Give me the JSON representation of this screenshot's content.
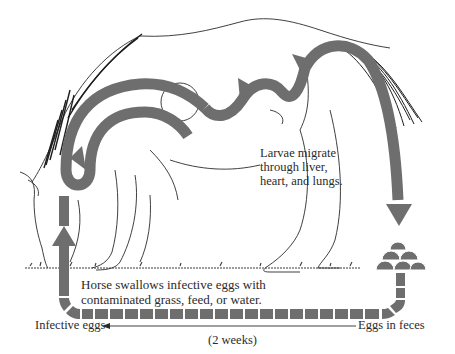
{
  "diagram": {
    "arrow_color": "#6e6e6e",
    "line_color": "#2a2a2a",
    "labels": {
      "migration": [
        "Larvae migrate",
        "through liver,",
        "heart, and lungs."
      ],
      "ingestion": [
        "Horse swallows infective eggs with",
        "contaminated grass, feed, or water."
      ],
      "infective_eggs": "Infective eggs",
      "eggs_in_feces": "Eggs in feces",
      "duration": "(2 weeks)"
    },
    "stages": [
      {
        "id": "ingestion",
        "description": "Horse swallows infective eggs"
      },
      {
        "id": "migration",
        "description": "Larvae migrate through liver, heart, and lungs"
      },
      {
        "id": "excretion",
        "description": "Eggs in feces"
      },
      {
        "id": "maturation",
        "description": "Eggs become infective in 2 weeks"
      }
    ]
  }
}
